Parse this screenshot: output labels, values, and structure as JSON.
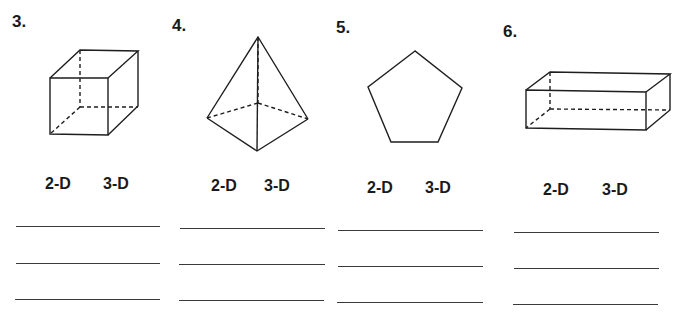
{
  "problems": [
    {
      "number": "3.",
      "shape": "cube",
      "options": [
        "2-D",
        "3-D"
      ],
      "answer_lines": 3
    },
    {
      "number": "4.",
      "shape": "triangular-pyramid",
      "options": [
        "2-D",
        "3-D"
      ],
      "answer_lines": 3
    },
    {
      "number": "5.",
      "shape": "pentagon",
      "options": [
        "2-D",
        "3-D"
      ],
      "answer_lines": 3
    },
    {
      "number": "6.",
      "shape": "rectangular-prism",
      "options": [
        "2-D",
        "3-D"
      ],
      "answer_lines": 3
    }
  ]
}
